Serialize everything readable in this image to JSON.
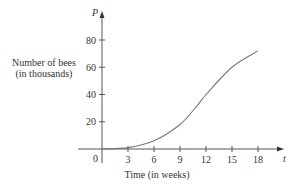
{
  "chart_data": {
    "type": "line",
    "title": "",
    "xlabel": "Time (in weeks)",
    "ylabel": "Number of bees (in thousands)",
    "x_axis_var": "t",
    "y_axis_var": "P",
    "x_ticks": [
      "0",
      "3",
      "6",
      "9",
      "12",
      "15",
      "18"
    ],
    "y_ticks": [
      "20",
      "40",
      "60",
      "80"
    ],
    "xlim": [
      0,
      19.5
    ],
    "ylim": [
      0,
      90
    ],
    "grid": false,
    "series": [
      {
        "name": "P(t)",
        "x": [
          0,
          3,
          6,
          9,
          11,
          12,
          15,
          18
        ],
        "values": [
          0,
          1,
          6,
          18,
          32,
          40,
          60,
          72
        ]
      }
    ]
  },
  "labels": {
    "ylabel_line1": "Number of bees",
    "ylabel_line2": "(in thousands)",
    "xlabel": "Time (in weeks)",
    "origin": "0",
    "x_var": "t",
    "y_var": "P"
  }
}
